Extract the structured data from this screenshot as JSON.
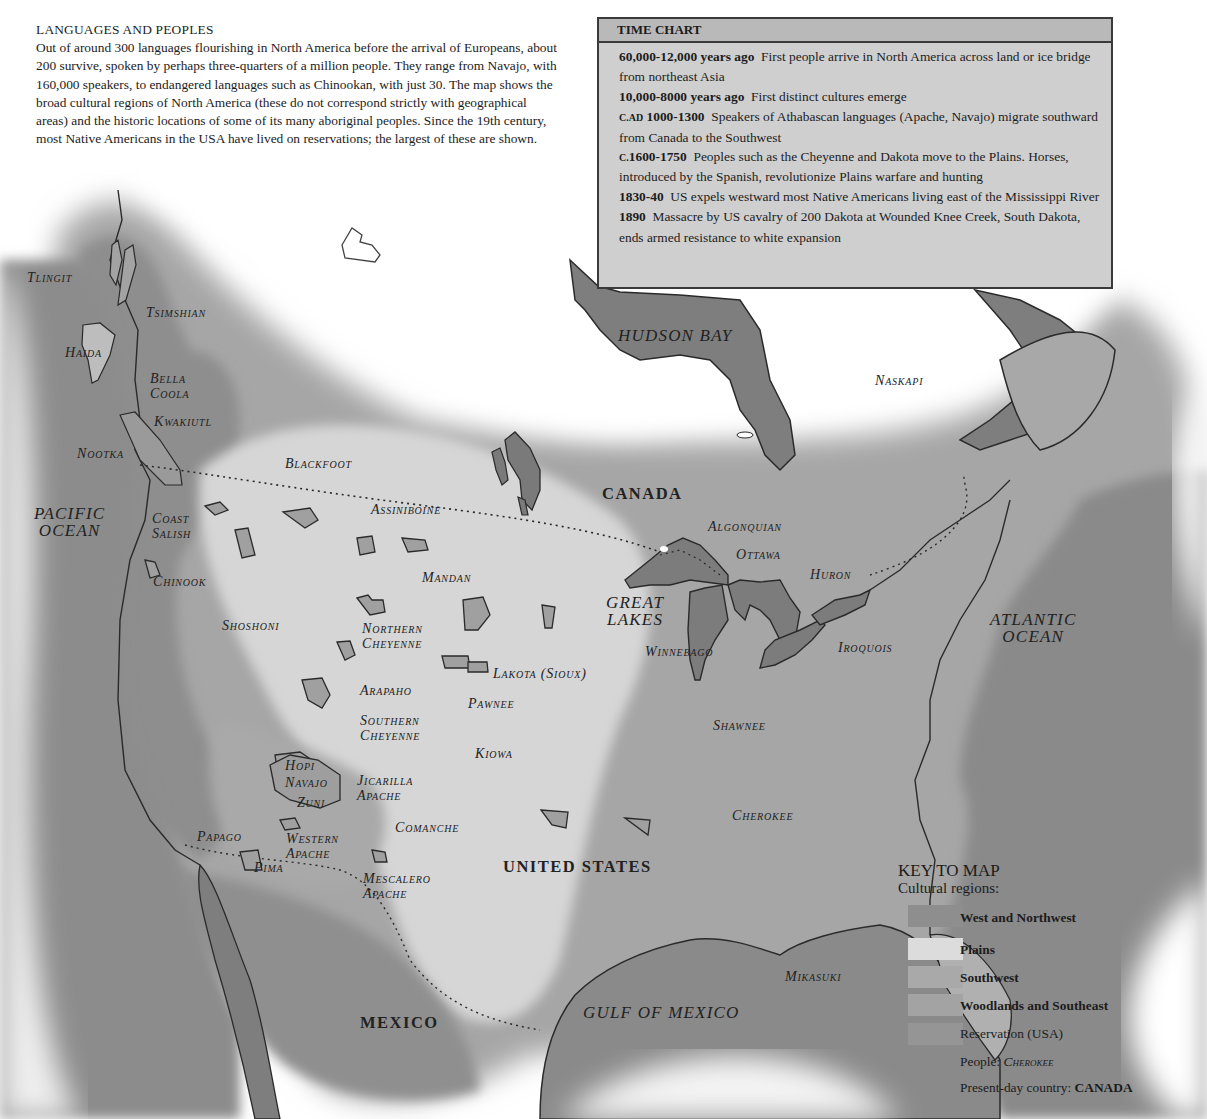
{
  "intro": {
    "title": "LANGUAGES AND PEOPLES",
    "body": "Out of around 300 languages flourishing in North America before the arrival of Europeans, about 200 survive, spoken by perhaps three-quarters of a million people. They range from Navajo, with 160,000 speakers, to endangered languages such as Chinookan, with just 30. The map shows the broad cultural regions of North America (these do not correspond strictly with geographical areas) and the historic locations of some of its many aboriginal peoples. Since the 19th century, most Native Americans in the USA have lived on reservations; the largest of these are shown."
  },
  "time_chart": {
    "title": "TIME CHART",
    "entries": [
      {
        "prefix": "",
        "date": "60,000-12,000 years ago",
        "text": "First people arrive in North America across land or ice bridge from northeast Asia"
      },
      {
        "prefix": "",
        "date": "10,000-8000 years ago",
        "text": "First distinct cultures emerge"
      },
      {
        "prefix": "C.AD",
        "date": "1000-1300",
        "text": "Speakers of Athabascan languages (Apache, Navajo) migrate southward from Canada to the Southwest"
      },
      {
        "prefix": "C.",
        "date": "1600-1750",
        "text": "Peoples such as the Cheyenne and Dakota move to the Plains. Horses, introduced by the Spanish, revolutionize Plains warfare and hunting"
      },
      {
        "prefix": "",
        "date": "1830-40",
        "text": "US expels westward most Native Americans living east of the Mississippi River"
      },
      {
        "prefix": "",
        "date": "1890",
        "text": "Massacre by US cavalry of 200 Dakota at Wounded Knee Creek, South Dakota, ends armed resistance to white expansion"
      }
    ]
  },
  "map": {
    "water_labels": {
      "pacific": "PACIFIC\nOCEAN",
      "atlantic": "ATLANTIC\nOCEAN",
      "hudson": "HUDSON BAY",
      "gulf": "GULF OF MEXICO",
      "great_lakes": "GREAT\nLAKES"
    },
    "countries": {
      "canada": "CANADA",
      "usa": "UNITED STATES",
      "mexico": "MEXICO"
    },
    "peoples": {
      "tlingit": "Tlingit",
      "tsimshian": "Tsimshian",
      "haida": "Haida",
      "bella_coola": "Bella\nCoola",
      "kwakiutl": "Kwakiutl",
      "nootka": "Nootka",
      "coast_salish": "Coast\nSalish",
      "chinook": "Chinook",
      "blackfoot": "Blackfoot",
      "assiniboine": "Assiniboine",
      "mandan": "Mandan",
      "shoshoni": "Shoshoni",
      "northern_cheyenne": "Northern\nCheyenne",
      "lakota": "Lakota (Sioux)",
      "arapaho": "Arapaho",
      "pawnee": "Pawnee",
      "southern_cheyenne": "Southern\nCheyenne",
      "kiowa": "Kiowa",
      "hopi": "Hopi",
      "navajo": "Navajo",
      "zuni": "Zuni",
      "jicarilla_apache": "Jicarilla\nApache",
      "comanche": "Comanche",
      "papago": "Papago",
      "western_apache": "Western\nApache",
      "pima": "Pima",
      "mescalero_apache": "Mescalero\nApache",
      "naskapi": "Naskapi",
      "algonquian": "Algonquian",
      "ottawa": "Ottawa",
      "huron": "Huron",
      "iroquois": "Iroquois",
      "winnebago": "Winnebago",
      "shawnee": "Shawnee",
      "cherokee": "Cherokee",
      "mikasuki": "Mikasuki"
    },
    "colors": {
      "west_northwest": "#8e8e8e",
      "plains": "#d4d4d4",
      "southwest": "#a9a9a9",
      "woodlands_southeast": "#a3a3a3",
      "reservation": "#8a8a8a",
      "water": "#7c7c7c",
      "outline": "#2a2a2a"
    }
  },
  "key": {
    "title": "KEY TO MAP",
    "subtitle": "Cultural regions:",
    "items": [
      {
        "label": "West and Northwest",
        "bold": true
      },
      {
        "label": "Plains",
        "bold": true
      },
      {
        "label": "Southwest",
        "bold": true
      },
      {
        "label": "Woodlands and Southeast",
        "bold": true
      },
      {
        "label": "Reservation (USA)",
        "bold": false
      }
    ],
    "people_label": "People:",
    "people_example": "Cherokee",
    "country_label": "Present-day country:",
    "country_example": "CANADA"
  }
}
